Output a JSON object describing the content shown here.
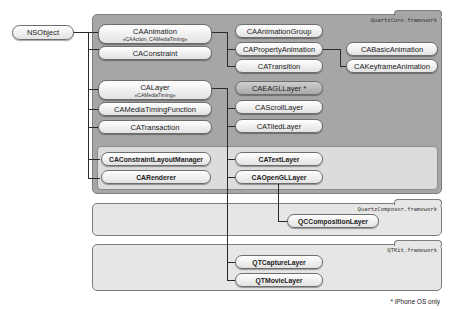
{
  "root_class": "NSObject",
  "frameworks": {
    "quartzcore": "QuartzCore.framework",
    "quartzcomposer": "QuartzComposer.framework",
    "qtkit": "QTKit.framework"
  },
  "classes": {
    "ca_animation": {
      "name": "CAAnimation",
      "protocols": "«CAAction, CAMediaTiming»"
    },
    "ca_constraint": {
      "name": "CAConstraint"
    },
    "ca_layer": {
      "name": "CALayer",
      "protocols": "«CAMediaTiming»"
    },
    "ca_media_timing_function": {
      "name": "CAMediaTimingFunction"
    },
    "ca_transaction": {
      "name": "CATransaction"
    },
    "ca_constraint_layout_manager": {
      "name": "CAConstraintLayoutManager"
    },
    "ca_renderer": {
      "name": "CARenderer"
    },
    "ca_animation_group": {
      "name": "CAAnimationGroup"
    },
    "ca_property_animation": {
      "name": "CAPropertyAnimation"
    },
    "ca_transition": {
      "name": "CATransition"
    },
    "ca_basic_animation": {
      "name": "CABasicAnimation"
    },
    "ca_keyframe_animation": {
      "name": "CAKeyframeAnimation"
    },
    "ca_eagl_layer": {
      "name": "CAEAGLLayer *"
    },
    "ca_scroll_layer": {
      "name": "CAScrollLayer"
    },
    "ca_tiled_layer": {
      "name": "CATiledLayer"
    },
    "ca_text_layer": {
      "name": "CATextLayer"
    },
    "ca_opengl_layer": {
      "name": "CAOpenGLLayer"
    },
    "qc_composition_layer": {
      "name": "QCCompositionLayer"
    },
    "qt_capture_layer": {
      "name": "QTCaptureLayer"
    },
    "qt_movie_layer": {
      "name": "QTMovieLayer"
    }
  },
  "footnote": "* iPhone OS only",
  "colors": {
    "quartzcore_bg": "#a6a6a6",
    "framework_bg": "#e6e6e6",
    "iphone_only_pill": "#b8b8b8"
  }
}
